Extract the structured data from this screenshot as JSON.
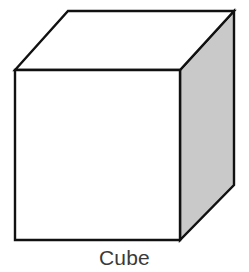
{
  "figure": {
    "caption": "Cube",
    "caption_color": "#3a3a3a",
    "background_color": "#ffffff",
    "shape_name": "cube",
    "outline_color": "#111111",
    "outline_width": 2.4,
    "faces": {
      "front": {
        "name": "front-face",
        "fill": "#ffffff",
        "points": "15,70 180,70 180,240 15,240"
      },
      "top": {
        "name": "top-face",
        "fill": "#ffffff",
        "points": "15,70 68,11 234,11 180,70"
      },
      "right": {
        "name": "right-face",
        "fill": "#c9c9c9",
        "points": "180,70 234,11 234,185 180,240"
      }
    },
    "vertices": {
      "front_top_left": [
        15,
        70
      ],
      "front_top_right": [
        180,
        70
      ],
      "front_bottom_right": [
        180,
        240
      ],
      "front_bottom_left": [
        15,
        240
      ],
      "back_top_left": [
        68,
        11
      ],
      "back_top_right": [
        234,
        11
      ],
      "back_bottom_right": [
        234,
        185
      ]
    }
  }
}
